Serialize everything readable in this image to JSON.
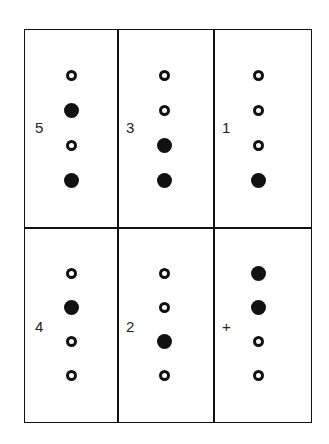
{
  "figure": {
    "cells": [
      {
        "label": "5",
        "dots": [
          "open",
          "filled",
          "open",
          "filled"
        ]
      },
      {
        "label": "3",
        "dots": [
          "open",
          "open",
          "filled",
          "filled"
        ]
      },
      {
        "label": "1",
        "dots": [
          "open",
          "open",
          "open",
          "filled"
        ]
      },
      {
        "label": "4",
        "dots": [
          "open",
          "filled",
          "open",
          "open"
        ]
      },
      {
        "label": "2",
        "dots": [
          "open",
          "open",
          "filled",
          "open"
        ]
      },
      {
        "label": "+",
        "dots": [
          "filled",
          "filled",
          "open",
          "open"
        ]
      }
    ]
  }
}
